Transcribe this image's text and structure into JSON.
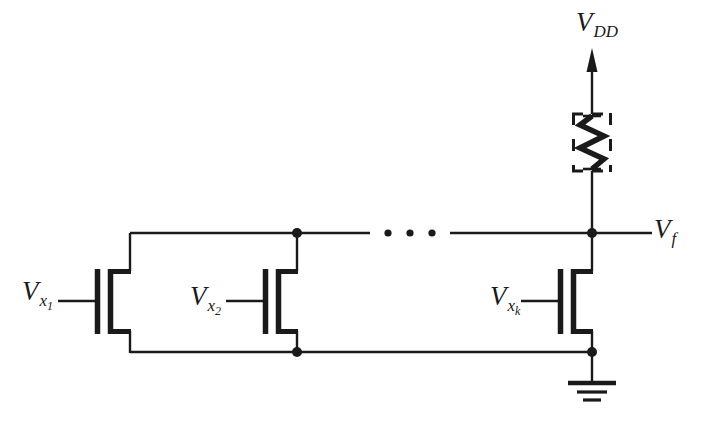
{
  "figure": {
    "type": "circuit-schematic",
    "background_color": "#ffffff",
    "line_color": "#1a1a1a"
  },
  "labels": {
    "supply": {
      "base": "V",
      "sub": "DD",
      "text": "V_DD"
    },
    "output": {
      "base": "V",
      "sub": "f",
      "text": "V_f"
    },
    "input_1": {
      "base": "V",
      "sub": "x",
      "subsub": "1",
      "text": "V_x1"
    },
    "input_2": {
      "base": "V",
      "sub": "x",
      "subsub": "2",
      "text": "V_x2"
    },
    "input_k": {
      "base": "V",
      "sub": "x",
      "subsub": "k",
      "text": "V_xk"
    }
  },
  "components": {
    "load_resistor": {
      "name": "load-resistor",
      "style": "zigzag",
      "enclosure": "dashed-box",
      "zigzag_peaks": 4
    },
    "ground": {
      "name": "ground-symbol",
      "bars": 3,
      "bar_widths": [
        48,
        30,
        18
      ]
    },
    "transistors": [
      {
        "name": "nmos-transistor-1",
        "gate_label": "V_x1",
        "type": "nmos"
      },
      {
        "name": "nmos-transistor-2",
        "gate_label": "V_x2",
        "type": "nmos"
      },
      {
        "name": "nmos-transistor-k",
        "gate_label": "V_xk",
        "type": "nmos"
      }
    ],
    "ellipsis": {
      "name": "continuation-dots",
      "count": 3
    },
    "junction_dots": [
      {
        "name": "junction-top-t2",
        "x": 297,
        "y": 233
      },
      {
        "name": "junction-top-tk",
        "x": 592,
        "y": 233
      },
      {
        "name": "junction-bottom-t2",
        "x": 297,
        "y": 352
      },
      {
        "name": "junction-bottom-tk",
        "x": 592,
        "y": 352
      }
    ]
  }
}
